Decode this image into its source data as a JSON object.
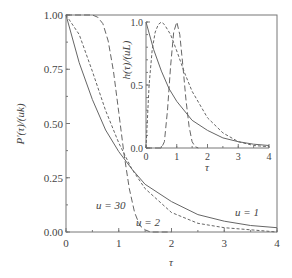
{
  "chart_data": [
    {
      "name": "main",
      "type": "line",
      "title": "",
      "xlabel": "τ",
      "ylabel": "P′(τ)/(uk)",
      "xlim": [
        0,
        4
      ],
      "ylim": [
        0,
        1
      ],
      "xticks": [
        "0",
        "1",
        "2",
        "3",
        "4"
      ],
      "yticks": [
        "0.00",
        "0.25",
        "0.50",
        "0.75",
        "1.00"
      ],
      "grid": false,
      "series": [
        {
          "name": "u = 1",
          "style": "solid",
          "x": [
            0,
            0.25,
            0.5,
            0.75,
            1.0,
            1.25,
            1.5,
            2.0,
            2.5,
            3.0,
            3.5,
            4.0
          ],
          "values": [
            1.0,
            0.78,
            0.61,
            0.47,
            0.37,
            0.29,
            0.22,
            0.14,
            0.08,
            0.05,
            0.03,
            0.02
          ]
        },
        {
          "name": "u = 2",
          "style": "dashed-short",
          "x": [
            0,
            0.25,
            0.5,
            0.75,
            1.0,
            1.25,
            1.5,
            2.0,
            2.5,
            3.0,
            3.5,
            4.0
          ],
          "values": [
            1.0,
            0.91,
            0.74,
            0.56,
            0.41,
            0.29,
            0.2,
            0.09,
            0.04,
            0.02,
            0.01,
            0.0
          ]
        },
        {
          "name": "u = 30",
          "style": "dashed-long",
          "x": [
            0,
            0.5,
            0.6,
            0.7,
            0.8,
            0.9,
            1.0,
            1.1,
            1.2,
            1.3,
            1.4,
            1.5,
            1.6,
            2.0
          ],
          "values": [
            1.0,
            1.0,
            0.99,
            0.96,
            0.88,
            0.74,
            0.55,
            0.36,
            0.2,
            0.09,
            0.03,
            0.01,
            0.0,
            0.0
          ]
        }
      ],
      "annotations": [
        {
          "text": "u = 30",
          "x": 0.6,
          "y": 0.1
        },
        {
          "text": "u = 2",
          "x": 1.6,
          "y": 0.03
        },
        {
          "text": "u = 1",
          "x": 3.3,
          "y": 0.07
        }
      ]
    },
    {
      "name": "inset",
      "type": "line",
      "title": "",
      "xlabel": "τ",
      "ylabel": "h(τ)/(uL)",
      "xlim": [
        0,
        4
      ],
      "ylim": [
        0,
        1
      ],
      "xticks": [
        "0",
        "1",
        "2",
        "3",
        "4"
      ],
      "yticks": [
        "0.0",
        "0.5",
        "1.0"
      ],
      "grid": false,
      "series": [
        {
          "name": "u = 1",
          "style": "solid",
          "x": [
            0,
            0.25,
            0.5,
            0.75,
            1.0,
            1.5,
            2.0,
            2.5,
            3.0,
            3.5,
            4.0
          ],
          "values": [
            1.0,
            0.78,
            0.61,
            0.47,
            0.37,
            0.22,
            0.14,
            0.08,
            0.05,
            0.03,
            0.02
          ]
        },
        {
          "name": "u = 2",
          "style": "dashed-short",
          "x": [
            0,
            0.1,
            0.2,
            0.3,
            0.4,
            0.5,
            0.6,
            0.8,
            1.0,
            1.25,
            1.5,
            2.0,
            2.5,
            3.0,
            3.5,
            4.0
          ],
          "values": [
            0.0,
            0.5,
            0.78,
            0.92,
            0.98,
            1.0,
            0.98,
            0.9,
            0.77,
            0.6,
            0.45,
            0.24,
            0.12,
            0.05,
            0.02,
            0.01
          ]
        },
        {
          "name": "u = 30",
          "style": "dashed-long",
          "x": [
            0,
            0.5,
            0.6,
            0.7,
            0.8,
            0.9,
            1.0,
            1.1,
            1.2,
            1.3,
            1.4,
            1.5,
            1.6,
            1.7
          ],
          "values": [
            0.0,
            0.0,
            0.05,
            0.3,
            0.65,
            0.92,
            1.0,
            0.9,
            0.65,
            0.38,
            0.17,
            0.05,
            0.01,
            0.0
          ]
        }
      ]
    }
  ]
}
